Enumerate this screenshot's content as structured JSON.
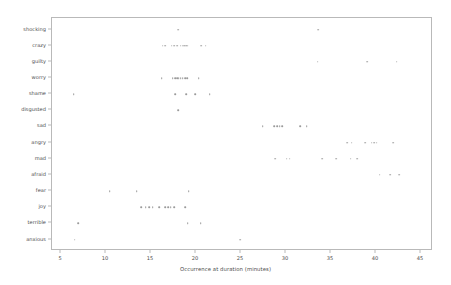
{
  "chart_data": {
    "type": "scatter",
    "title": "",
    "xlabel": "Occurrence at duration (minutes)",
    "ylabel": "",
    "xlim": [
      4.0,
      46.4
    ],
    "xticks": [
      5,
      10,
      15,
      20,
      25,
      30,
      35,
      40,
      45
    ],
    "xticklabels": [
      "5",
      "10",
      "15",
      "20",
      "25",
      "30",
      "35",
      "40",
      "45"
    ],
    "grid": false,
    "legend": null,
    "marker": {
      "style": "dot",
      "color": "#9a9a9a",
      "size_px": 1.6
    },
    "categories": [
      "shocking",
      "crazy",
      "guilty",
      "worry",
      "shame",
      "disgusted",
      "sad",
      "angry",
      "mad",
      "afraid",
      "fear",
      "joy",
      "terrible",
      "anxious"
    ],
    "series": [
      {
        "name": "shocking",
        "x": [
          18.0,
          33.6
        ]
      },
      {
        "name": "crazy",
        "x": [
          16.3,
          16.6,
          17.3,
          17.6,
          17.9,
          18.3,
          18.5,
          18.7,
          18.9,
          19.1,
          20.6,
          21.1
        ]
      },
      {
        "name": "guilty",
        "x": [
          33.5,
          39.0,
          42.3
        ]
      },
      {
        "name": "worry",
        "x": [
          16.2,
          17.4,
          17.7,
          17.9,
          18.1,
          18.3,
          18.5,
          18.8,
          19.0,
          20.3
        ]
      },
      {
        "name": "shame",
        "x": [
          6.4,
          17.7,
          18.9,
          19.9,
          21.5
        ]
      },
      {
        "name": "disgusted",
        "x": [
          18.0
        ]
      },
      {
        "name": "sad",
        "x": [
          27.4,
          28.7,
          29.0,
          29.3,
          29.6,
          31.6,
          32.3
        ]
      },
      {
        "name": "angry",
        "x": [
          36.8,
          37.3,
          38.8,
          39.5,
          39.8,
          40.1,
          41.9
        ]
      },
      {
        "name": "mad",
        "x": [
          28.8,
          30.1,
          30.4,
          34.0,
          35.6,
          37.2,
          37.9
        ]
      },
      {
        "name": "afraid",
        "x": [
          40.4,
          41.6,
          42.6
        ]
      },
      {
        "name": "fear",
        "x": [
          10.4,
          13.4,
          19.2
        ]
      },
      {
        "name": "joy",
        "x": [
          13.9,
          14.4,
          14.8,
          15.2,
          15.9,
          16.6,
          16.9,
          17.2,
          17.6,
          18.8
        ]
      },
      {
        "name": "terrible",
        "x": [
          6.9,
          19.1,
          20.5
        ]
      },
      {
        "name": "anxious",
        "x": [
          6.5,
          24.9
        ]
      }
    ]
  }
}
